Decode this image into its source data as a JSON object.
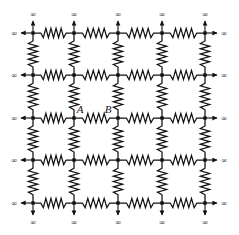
{
  "figure": {
    "background_color": "#ffffff",
    "ink_color": "#111111",
    "width": 239,
    "height": 235
  },
  "lattice": {
    "rows": 5,
    "cols": 5,
    "node_x": [
      33,
      74,
      118,
      162,
      205
    ],
    "node_y": [
      33,
      75,
      118,
      160,
      203
    ],
    "node_marker": "filled-square",
    "node_marker_size": 3.4,
    "resistor": {
      "symbol": "zigzag",
      "peaks": 5,
      "amplitude": 4.6,
      "span_ratio": 0.62,
      "stroke_width": 1.25
    },
    "wire_stroke_width": 1.1
  },
  "boundary": {
    "infinity_symbol": "∞",
    "arrow_label": "infinity-arrow",
    "stub_length": 12,
    "edges": [
      {
        "side": "left",
        "count": 5,
        "direction": "outward-left"
      },
      {
        "side": "right",
        "count": 5,
        "direction": "outward-right"
      },
      {
        "side": "top",
        "count": 5,
        "direction": "outward-up"
      },
      {
        "side": "bottom",
        "count": 5,
        "direction": "outward-down"
      }
    ]
  },
  "labels": {
    "node_a": {
      "text": "A",
      "node_row": 2,
      "node_col": 1,
      "offset_x": 6,
      "offset_y": -5
    },
    "node_b": {
      "text": "B",
      "node_row": 2,
      "node_col": 2,
      "offset_x": -10,
      "offset_y": -5
    }
  }
}
